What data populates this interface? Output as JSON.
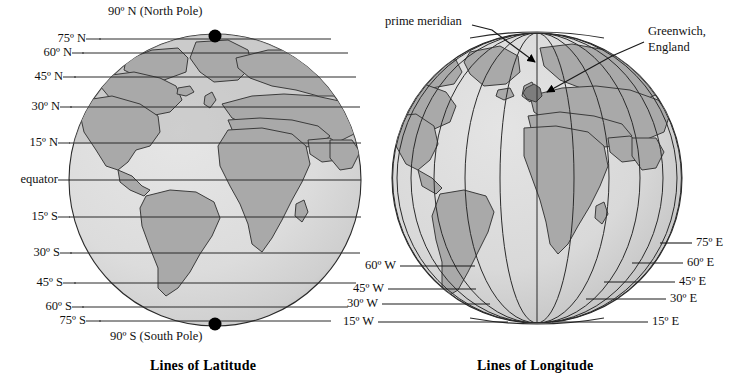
{
  "figure": {
    "background_color": "#ffffff",
    "ocean_color": "#dcdcdc",
    "land_color": "#a9a9a9",
    "shadow_color": "#b8b8b8",
    "line_color": "#1a1a1a",
    "text_color": "#111111"
  },
  "panels": [
    {
      "id": "latitude",
      "caption": "Lines of Latitude",
      "globe": {
        "cx": 215,
        "cy": 180,
        "r": 146
      },
      "poles": [
        {
          "name": "north-pole-dot",
          "label": "90º N (North Pole)",
          "deg": 90
        },
        {
          "name": "south-pole-dot",
          "label": "90º S (South Pole)",
          "deg": -90
        }
      ],
      "parallels": [
        {
          "label": "75º N",
          "deg": 75
        },
        {
          "label": "60º N",
          "deg": 60
        },
        {
          "label": "45º N",
          "deg": 45
        },
        {
          "label": "30º N",
          "deg": 30
        },
        {
          "label": "15º N",
          "deg": 15
        },
        {
          "label": "equator",
          "deg": 0
        },
        {
          "label": "15º S",
          "deg": -15
        },
        {
          "label": "30º S",
          "deg": -30
        },
        {
          "label": "45º S",
          "deg": -45
        },
        {
          "label": "60º S",
          "deg": -60
        },
        {
          "label": "75º S",
          "deg": -75
        }
      ]
    },
    {
      "id": "longitude",
      "caption": "Lines of Longitude",
      "globe": {
        "cx": 537,
        "cy": 178,
        "r": 145
      },
      "annotations": [
        {
          "name": "prime-meridian",
          "label": "prime meridian",
          "deg": 0
        },
        {
          "name": "greenwich",
          "label_line1": "Greenwich,",
          "label_line2": "England"
        }
      ],
      "meridians_west": [
        {
          "label": "60º W",
          "deg": -60
        },
        {
          "label": "45º W",
          "deg": -45
        },
        {
          "label": "30º W",
          "deg": -30
        },
        {
          "label": "15º W",
          "deg": -15
        }
      ],
      "meridians_east": [
        {
          "label": "75º E",
          "deg": 75
        },
        {
          "label": "60º E",
          "deg": 60
        },
        {
          "label": "45º E",
          "deg": 45
        },
        {
          "label": "30º E",
          "deg": 30
        },
        {
          "label": "15º E",
          "deg": 15
        }
      ]
    }
  ]
}
